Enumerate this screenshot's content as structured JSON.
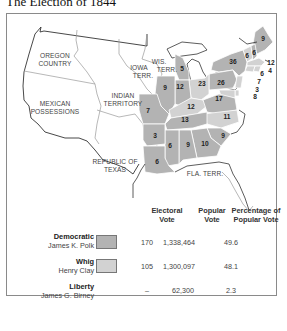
{
  "title": "The Election of 1844",
  "colors": {
    "democratic": "#b3b3b3",
    "whig": "#d2d2d2",
    "border": "#8a8a8a",
    "state_lines": "#ffffff"
  },
  "map": {
    "region_labels": [
      {
        "id": "oregon",
        "lines": [
          "OREGON",
          "COUNTRY"
        ]
      },
      {
        "id": "mexican",
        "lines": [
          "MEXICAN",
          "POSSESSIONS"
        ]
      },
      {
        "id": "indian",
        "lines": [
          "INDIAN",
          "TERRITORY"
        ]
      },
      {
        "id": "iowa",
        "lines": [
          "IOWA",
          "TERR."
        ]
      },
      {
        "id": "wis",
        "lines": [
          "WIS.",
          "TERR."
        ]
      },
      {
        "id": "texas",
        "lines": [
          "REPUBLIC OF",
          "TEXAS"
        ]
      },
      {
        "id": "fla",
        "lines": [
          "FLA. TERR."
        ]
      }
    ],
    "electoral_votes": [
      {
        "state": "Maine",
        "votes": "9"
      },
      {
        "state": "Vermont",
        "votes": "6"
      },
      {
        "state": "New Hampshire",
        "votes": "6"
      },
      {
        "state": "Massachusetts",
        "votes": "12"
      },
      {
        "state": "Rhode Island",
        "votes": "4"
      },
      {
        "state": "Connecticut",
        "votes": "6"
      },
      {
        "state": "New York",
        "votes": "36"
      },
      {
        "state": "New Jersey",
        "votes": "7"
      },
      {
        "state": "Delaware",
        "votes": "3"
      },
      {
        "state": "Maryland",
        "votes": "8"
      },
      {
        "state": "Pennsylvania",
        "votes": "26"
      },
      {
        "state": "Ohio",
        "votes": "23"
      },
      {
        "state": "Michigan",
        "votes": "5"
      },
      {
        "state": "Indiana",
        "votes": "12"
      },
      {
        "state": "Illinois",
        "votes": "9"
      },
      {
        "state": "Missouri",
        "votes": "7"
      },
      {
        "state": "Kentucky",
        "votes": "12"
      },
      {
        "state": "Virginia",
        "votes": "17"
      },
      {
        "state": "North Carolina",
        "votes": "11"
      },
      {
        "state": "Tennessee",
        "votes": "13"
      },
      {
        "state": "South Carolina",
        "votes": "9"
      },
      {
        "state": "Georgia",
        "votes": "10"
      },
      {
        "state": "Alabama",
        "votes": "9"
      },
      {
        "state": "Mississippi",
        "votes": "6"
      },
      {
        "state": "Arkansas",
        "votes": "3"
      },
      {
        "state": "Louisiana",
        "votes": "6"
      }
    ]
  },
  "legend": {
    "headers": {
      "electoral": [
        "Electoral",
        "Vote"
      ],
      "popular": [
        "Popular",
        "Vote"
      ],
      "percentage": [
        "Percentage of",
        "Popular Vote"
      ]
    },
    "rows": [
      {
        "party": "Democratic",
        "candidate": "James K. Polk",
        "electoral": "170",
        "popular": "1,338,464",
        "percentage": "49.6",
        "swatch": true
      },
      {
        "party": "Whig",
        "candidate": "Henry Clay",
        "electoral": "105",
        "popular": "1,300,097",
        "percentage": "48.1",
        "swatch": true
      },
      {
        "party": "Liberty",
        "candidate": "James G. Birney",
        "electoral": "–",
        "popular": "62,300",
        "percentage": "2.3",
        "swatch": false
      }
    ]
  }
}
